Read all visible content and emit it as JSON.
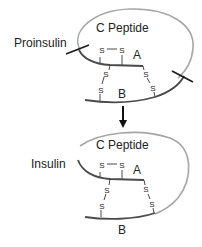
{
  "colors": {
    "c_peptide_loop": "#a6a6a6",
    "chain": "#4a4a4a",
    "text": "#222222",
    "cut_line": "#1a1a1a"
  },
  "proinsulin": {
    "label": "Proinsulin",
    "c_peptide_label": "C Peptide",
    "chain_a_label": "A",
    "chain_b_label": "B",
    "intrachain_bond": {
      "s1": "S",
      "s2": "S"
    },
    "interchain_bonds": [
      {
        "top": "S",
        "bottom": "S"
      },
      {
        "top": "S",
        "bottom": "S"
      }
    ]
  },
  "arrow": {
    "direction": "down"
  },
  "insulin": {
    "label": "Insulin",
    "c_peptide_label": "C Peptide",
    "chain_a_label": "A",
    "chain_b_label": "B",
    "intrachain_bond": {
      "s1": "S",
      "s2": "S"
    },
    "interchain_bonds": [
      {
        "top": "S",
        "bottom": "S"
      },
      {
        "top": "S",
        "bottom": "S"
      }
    ]
  }
}
